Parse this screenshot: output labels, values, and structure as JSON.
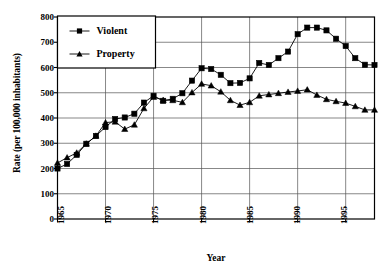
{
  "chart_data": {
    "type": "line",
    "title": "",
    "xlabel": "Year",
    "ylabel": "Rate (per 100,000 inhabitants)",
    "xlim": [
      1965,
      1998
    ],
    "ylim": [
      0,
      800
    ],
    "ytick_step": 100,
    "yticks": [
      "0",
      "100",
      "200",
      "300",
      "400",
      "500",
      "600",
      "700",
      "800"
    ],
    "xticks": [
      "1965",
      "1970",
      "1975",
      "1980",
      "1985",
      "1990",
      "1995"
    ],
    "grid": true,
    "legend_position": "upper-left",
    "x": [
      1965,
      1966,
      1967,
      1968,
      1969,
      1970,
      1971,
      1972,
      1973,
      1974,
      1975,
      1976,
      1977,
      1978,
      1979,
      1980,
      1981,
      1982,
      1983,
      1984,
      1985,
      1986,
      1987,
      1988,
      1989,
      1990,
      1991,
      1992,
      1993,
      1994,
      1995,
      1996,
      1997,
      1998
    ],
    "series": [
      {
        "name": "Violent",
        "marker": "square",
        "color": "#000000",
        "values": [
          200,
          218,
          254,
          298,
          329,
          364,
          396,
          402,
          417,
          461,
          488,
          468,
          476,
          498,
          548,
          597,
          594,
          571,
          538,
          539,
          557,
          618,
          610,
          637,
          663,
          732,
          758,
          758,
          747,
          714,
          685,
          637,
          611,
          610
        ]
      },
      {
        "name": "Property",
        "marker": "triangle",
        "color": "#000000",
        "values": [
          222,
          243,
          262,
          298,
          329,
          382,
          385,
          356,
          373,
          438,
          483,
          471,
          470,
          462,
          501,
          535,
          528,
          504,
          470,
          451,
          462,
          488,
          493,
          498,
          503,
          507,
          512,
          491,
          474,
          466,
          459,
          446,
          432,
          432
        ]
      }
    ],
    "legend": [
      {
        "label": "Violent",
        "marker": "square"
      },
      {
        "label": "Property",
        "marker": "triangle"
      }
    ]
  }
}
